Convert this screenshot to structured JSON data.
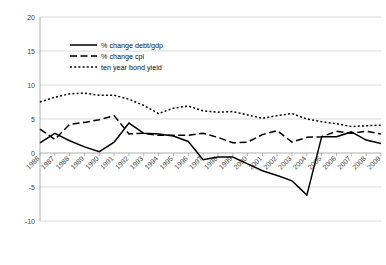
{
  "chart_data": {
    "type": "line",
    "title": "",
    "xlabel": "",
    "ylabel": "",
    "grid": true,
    "legend_position": "top-left-inside",
    "ylim": [
      -10,
      20
    ],
    "yticks": [
      20,
      15,
      10,
      5,
      0,
      -5,
      -10
    ],
    "categories": [
      "1986",
      "1987",
      "1988",
      "1989",
      "1990",
      "1991",
      "1992",
      "1993",
      "1994",
      "1995",
      "1996",
      "1997",
      "1998",
      "1999",
      "2000",
      "2001",
      "2002",
      "2003",
      "2004",
      "2005",
      "2006",
      "2007",
      "2008",
      "2009"
    ],
    "series": [
      {
        "name": "% change debt/gdp",
        "style": "solid",
        "values": [
          1.5,
          2.9,
          1.8,
          0.9,
          0.2,
          1.6,
          4.4,
          2.9,
          2.8,
          2.5,
          1.7,
          -1.0,
          -0.6,
          -0.6,
          -1.6,
          -2.6,
          -3.3,
          -4.1,
          -6.2,
          0.4,
          2.4,
          3.1,
          1.9,
          1.4
        ]
      },
      {
        "name": "% change cpi",
        "style": "dashed",
        "values": [
          3.5,
          2.0,
          4.2,
          4.5,
          4.9,
          5.5,
          2.8,
          2.9,
          2.6,
          2.6,
          2.6,
          2.9,
          2.3,
          1.5,
          1.6,
          2.7,
          3.3,
          1.6,
          2.3,
          2.4,
          3.2,
          2.9,
          3.2,
          2.8
        ]
      },
      {
        "name": "ten year bond yield",
        "style": "dotted",
        "values": [
          7.5,
          8.2,
          8.7,
          8.8,
          8.5,
          8.5,
          7.9,
          7.0,
          5.8,
          6.6,
          6.9,
          6.2,
          6.0,
          6.1,
          5.6,
          5.1,
          5.5,
          5.8,
          5.0,
          4.6,
          4.3,
          3.9,
          4.0,
          4.1
        ]
      }
    ],
    "series_overrides": {
      "debt_gdp_actual": [
        1.5,
        2.9,
        1.8,
        0.9,
        0.2,
        1.6,
        4.4,
        2.9,
        2.8,
        2.5,
        1.7,
        -1.0,
        -0.6,
        -0.6,
        -1.6,
        -2.6,
        -3.3,
        -4.1,
        -6.2,
        2.4,
        2.4,
        3.1,
        1.9,
        1.4
      ]
    }
  },
  "legend": {
    "entries": [
      {
        "label": "% change debt/gdp",
        "style": "solid"
      },
      {
        "label": "% change cpi",
        "style": "dashed"
      },
      {
        "label": "ten year bond yield",
        "style": "dotted"
      }
    ]
  },
  "axes": {
    "y_labels": [
      "20",
      "15",
      "10",
      "5",
      "0",
      "-5",
      "-10"
    ],
    "x_labels": [
      "1986",
      "1987",
      "1988",
      "1989",
      "1990",
      "1991",
      "1992",
      "1993",
      "1994",
      "1995",
      "1996",
      "1997",
      "1998",
      "1999",
      "2000",
      "2001",
      "2002",
      "2003",
      "2004",
      "2005",
      "2006",
      "2007",
      "2008",
      "2009"
    ]
  },
  "colors": {
    "line": "#000000",
    "grid": "#c8c8c8",
    "axis": "#9a9a9a",
    "tick_text": "#444444",
    "background": "#ffffff"
  }
}
